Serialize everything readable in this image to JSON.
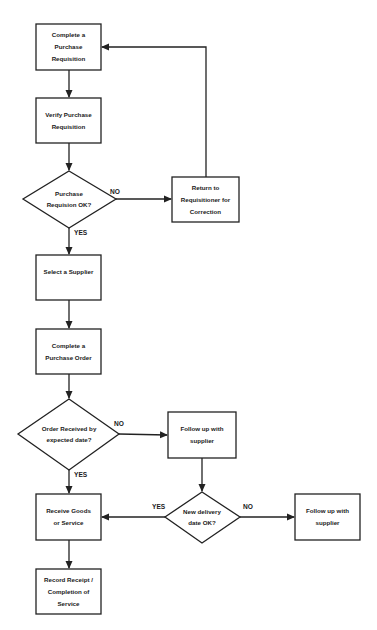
{
  "diagram": {
    "type": "flowchart",
    "nodes": {
      "complete_req": {
        "shape": "process",
        "lines": [
          "Complete a",
          "Purchase",
          "Requisition"
        ]
      },
      "verify_req": {
        "shape": "process",
        "lines": [
          "Verify Purchase",
          "Requisition"
        ]
      },
      "req_ok": {
        "shape": "decision",
        "lines": [
          "Purchase",
          "Requision OK?"
        ]
      },
      "return_req": {
        "shape": "process",
        "lines": [
          "Return to",
          "Requisitioner for",
          "Correction"
        ]
      },
      "select_supplier": {
        "shape": "process",
        "lines": [
          "Select a Supplier"
        ]
      },
      "complete_po": {
        "shape": "process",
        "lines": [
          "Complete a",
          "Purchase Order"
        ]
      },
      "order_received": {
        "shape": "decision",
        "lines": [
          "Order Received by",
          "expected date?"
        ]
      },
      "follow_up_1": {
        "shape": "process",
        "lines": [
          "Follow up with",
          "supplier"
        ]
      },
      "new_date_ok": {
        "shape": "decision",
        "lines": [
          "New delivery",
          "date OK?"
        ]
      },
      "follow_up_2": {
        "shape": "process",
        "lines": [
          "Follow up with",
          "supplier"
        ]
      },
      "receive_goods": {
        "shape": "process",
        "lines": [
          "Receive Goods",
          "or Service"
        ]
      },
      "record_receipt": {
        "shape": "process",
        "lines": [
          "Record Receipt /",
          "Completion of",
          "Service"
        ]
      }
    },
    "edges": [
      {
        "from": "complete_req",
        "to": "verify_req",
        "label": ""
      },
      {
        "from": "verify_req",
        "to": "req_ok",
        "label": ""
      },
      {
        "from": "req_ok",
        "to": "return_req",
        "label": "NO"
      },
      {
        "from": "return_req",
        "to": "complete_req",
        "label": ""
      },
      {
        "from": "req_ok",
        "to": "select_supplier",
        "label": "YES"
      },
      {
        "from": "select_supplier",
        "to": "complete_po",
        "label": ""
      },
      {
        "from": "complete_po",
        "to": "order_received",
        "label": ""
      },
      {
        "from": "order_received",
        "to": "follow_up_1",
        "label": "NO"
      },
      {
        "from": "order_received",
        "to": "receive_goods",
        "label": "YES"
      },
      {
        "from": "follow_up_1",
        "to": "new_date_ok",
        "label": ""
      },
      {
        "from": "new_date_ok",
        "to": "receive_goods",
        "label": "YES"
      },
      {
        "from": "new_date_ok",
        "to": "follow_up_2",
        "label": "NO"
      },
      {
        "from": "receive_goods",
        "to": "record_receipt",
        "label": ""
      }
    ],
    "edge_labels": {
      "req_no": "NO",
      "req_yes": "YES",
      "order_no": "NO",
      "order_yes": "YES",
      "date_yes": "YES",
      "date_no": "NO"
    }
  }
}
